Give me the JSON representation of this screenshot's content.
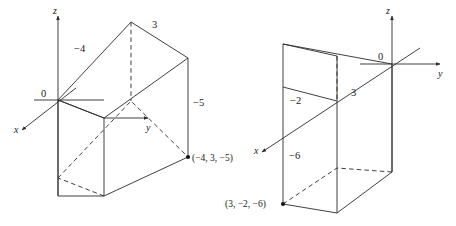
{
  "figure": {
    "background_color": "#ffffff",
    "line_color": "#2b2b2b",
    "text_color": "#1a1a1a"
  },
  "diagrams": [
    {
      "id": "left-diagram",
      "name": "box-for-point-negative4-3-negative5",
      "axes": {
        "x_label": "x",
        "y_label": "y",
        "z_label": "z",
        "origin_label": "0"
      },
      "edge_labels": {
        "x_extent": "−4",
        "y_extent": "3",
        "z_extent": "−5"
      },
      "point_label": "(−4, 3, −5)"
    },
    {
      "id": "right-diagram",
      "name": "box-for-point-3-negative2-negative6",
      "axes": {
        "x_label": "x",
        "y_label": "y",
        "z_label": "z",
        "origin_label": "0"
      },
      "edge_labels": {
        "x_extent": "3",
        "y_extent": "−2",
        "z_extent": "−6"
      },
      "point_label": "(3, −2, −6)"
    }
  ]
}
